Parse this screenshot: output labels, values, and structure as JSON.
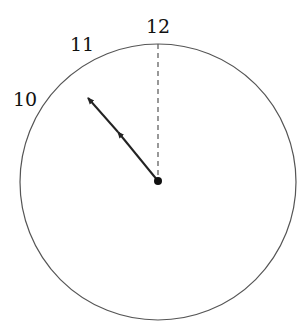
{
  "diagram": {
    "type": "clock-face",
    "labels": [
      {
        "text": "12",
        "x": 158,
        "y": 34
      },
      {
        "text": "11",
        "x": 86,
        "y": 52
      },
      {
        "text": "10",
        "x": 28,
        "y": 106
      }
    ],
    "center": {
      "x": 158,
      "y": 181
    },
    "radius": 138,
    "hand": {
      "to_x": 87,
      "to_y": 97,
      "mid_arrow_x": 118,
      "mid_arrow_y": 133
    },
    "reference_line": {
      "style": "dashed",
      "direction": "12"
    },
    "colors": {
      "stroke": "#222222",
      "circle": "#555555"
    }
  }
}
